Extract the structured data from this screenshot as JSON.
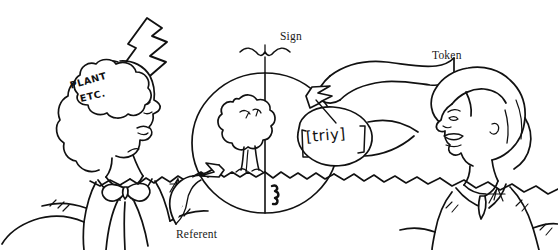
{
  "figure": {
    "background_color": "#ffffff",
    "ink_color": "#111111",
    "labels": {
      "sign": "Sign",
      "token": "Token",
      "referent": "Referent"
    },
    "mind_bubble": {
      "line_1": "PLANT",
      "line_2": "ETC."
    },
    "speech_bubble": {
      "transcription": "[triy]"
    },
    "figures": {
      "left_person": "man-in-bow-tie-listening",
      "right_person": "woman-speaking"
    },
    "circle_halves": {
      "left": "tree-referent",
      "right": "phonetic-token"
    }
  }
}
